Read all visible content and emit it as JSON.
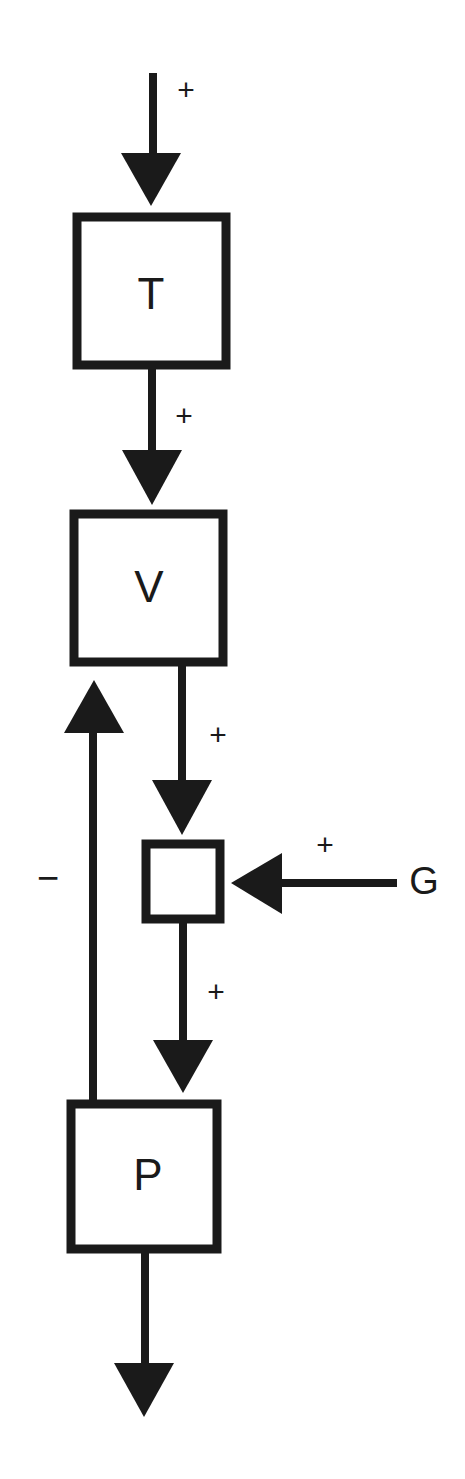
{
  "diagram": {
    "type": "block-flow",
    "colors": {
      "ink": "#1a1a1a",
      "background": "#ffffff"
    },
    "nodes": [
      {
        "id": "T",
        "label": "T"
      },
      {
        "id": "V",
        "label": "V"
      },
      {
        "id": "junction",
        "label": ""
      },
      {
        "id": "P",
        "label": "P"
      }
    ],
    "external_inputs": [
      {
        "id": "G",
        "label": "G"
      }
    ],
    "edges": [
      {
        "from": "input",
        "to": "T",
        "sign": "+"
      },
      {
        "from": "T",
        "to": "V",
        "sign": "+"
      },
      {
        "from": "V",
        "to": "junction",
        "sign": "+"
      },
      {
        "from": "G",
        "to": "junction",
        "sign": "+"
      },
      {
        "from": "junction",
        "to": "P",
        "sign": "+"
      },
      {
        "from": "P",
        "to": "V",
        "sign": "−"
      },
      {
        "from": "P",
        "to": "output",
        "sign": ""
      }
    ],
    "signs": {
      "input_to_T": "+",
      "T_to_V": "+",
      "V_to_junction": "+",
      "G_to_junction": "+",
      "junction_to_P": "+",
      "P_to_V_feedback": "−"
    }
  }
}
